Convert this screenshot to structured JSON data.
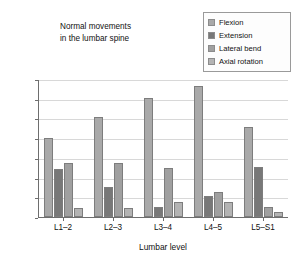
{
  "chart_data": {
    "type": "bar",
    "title": "Normal movements in the lumbar spine",
    "title_lines": [
      "Normal movements",
      "in the lumbar spine"
    ],
    "xlabel": "Lumbar level",
    "ylabel": "Range of movement (degrees)",
    "categories": [
      "L1–2",
      "L2–3",
      "L3–4",
      "L4–5",
      "L5–S1"
    ],
    "ylim": [
      0,
      14
    ],
    "yticks": [
      0,
      2,
      4,
      6,
      8,
      10,
      12,
      14
    ],
    "grid": true,
    "legend_position": "top-right",
    "series": [
      {
        "name": "Flexion",
        "color": "#a9a9a9",
        "values": [
          8.0,
          10.1,
          12.1,
          13.25,
          9.15
        ]
      },
      {
        "name": "Extension",
        "color": "#787878",
        "values": [
          4.9,
          3.0,
          1.0,
          2.15,
          5.1
        ]
      },
      {
        "name": "Lateral bend",
        "color": "#a0a0a0",
        "values": [
          5.45,
          5.5,
          5.0,
          2.5,
          1.05
        ]
      },
      {
        "name": "Axial rotation",
        "color": "#b4b4b4",
        "values": [
          0.9,
          0.95,
          1.5,
          1.5,
          0.5
        ]
      }
    ]
  }
}
